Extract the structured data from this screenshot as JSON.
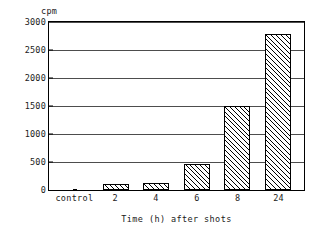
{
  "chart_data": {
    "type": "bar",
    "title": "",
    "subtitle": "",
    "xlabel": "Time (h) after shots",
    "ylabel": "cpm",
    "categories": [
      "control",
      "2",
      "4",
      "6",
      "8",
      "24"
    ],
    "values": [
      15,
      100,
      130,
      470,
      1500,
      2780
    ],
    "series": [
      {
        "name": "cpm",
        "values": [
          15,
          100,
          130,
          470,
          1500,
          2780
        ]
      }
    ],
    "ylim": [
      0,
      3000
    ],
    "ytick_labels": [
      "3000",
      "2500",
      "2000",
      "1500",
      "1000",
      "500",
      "0"
    ],
    "ytick_values": [
      3000,
      2500,
      2000,
      1500,
      1000,
      500,
      0
    ],
    "grid": "horizontal",
    "legend": "none",
    "bar_fill": "diagonal-hatch",
    "colors": {
      "axis": "#000000",
      "grid": "#4d4d4d",
      "bar_outline": "#000000",
      "bar_hatch": "#000000",
      "background": "#ffffff"
    },
    "annotations": []
  }
}
